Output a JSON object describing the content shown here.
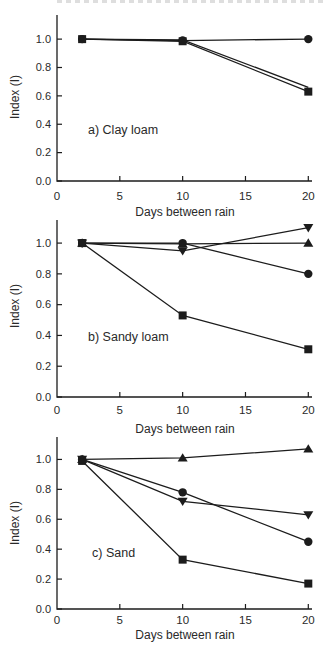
{
  "page": {
    "background": "#ffffff",
    "ink_color": "#1c1c1c",
    "text_color": "#2a2a2a"
  },
  "chart_data": [
    {
      "type": "line",
      "panel_label": "a) Clay loam",
      "xlabel": "Days between rain",
      "ylabel": "Index (I)",
      "x": [
        2,
        10,
        20
      ],
      "xticks": [
        0,
        5,
        10,
        15,
        20
      ],
      "yticks": [
        "0.0",
        "0.2",
        "0.4",
        "0.6",
        "0.8",
        "1.0"
      ],
      "xlim": [
        0,
        20
      ],
      "ylim": [
        0,
        1.17
      ],
      "grid": false,
      "legend": "none",
      "series": [
        {
          "name": "unmarked-companion-line",
          "marker": "none",
          "values": [
            1.0,
            0.995,
            0.66
          ]
        },
        {
          "name": "filled-square",
          "marker": "square",
          "values": [
            1.0,
            0.985,
            0.63
          ]
        },
        {
          "name": "filled-circle",
          "marker": "circle",
          "values": [
            1.0,
            0.99,
            1.0
          ]
        }
      ]
    },
    {
      "type": "line",
      "panel_label": "b) Sandy loam",
      "xlabel": "Days between rain",
      "ylabel": "Index (I)",
      "x": [
        2,
        10,
        20
      ],
      "xticks": [
        0,
        5,
        10,
        15,
        20
      ],
      "yticks": [
        "0.0",
        "0.2",
        "0.4",
        "0.6",
        "0.8",
        "1.0"
      ],
      "xlim": [
        0,
        20
      ],
      "ylim": [
        0,
        1.15
      ],
      "grid": false,
      "legend": "none",
      "series": [
        {
          "name": "filled-square",
          "marker": "square",
          "values": [
            1.0,
            0.53,
            0.31
          ]
        },
        {
          "name": "filled-triangle-down",
          "marker": "triangle-down",
          "values": [
            1.0,
            0.95,
            1.1
          ]
        },
        {
          "name": "filled-triangle-up",
          "marker": "triangle-up",
          "values": [
            1.0,
            0.995,
            1.0
          ]
        },
        {
          "name": "filled-circle",
          "marker": "circle",
          "values": [
            1.0,
            1.0,
            0.8
          ]
        }
      ]
    },
    {
      "type": "line",
      "panel_label": "c) Sand",
      "xlabel": "Days between rain",
      "ylabel": "Index (I)",
      "x": [
        2,
        10,
        20
      ],
      "xticks": [
        0,
        5,
        10,
        15,
        20
      ],
      "yticks": [
        "0.0",
        "0.2",
        "0.4",
        "0.6",
        "0.8",
        "1.0"
      ],
      "xlim": [
        0,
        20
      ],
      "ylim": [
        0,
        1.15
      ],
      "grid": false,
      "legend": "none",
      "series": [
        {
          "name": "filled-square",
          "marker": "square",
          "values": [
            0.99,
            0.33,
            0.17
          ]
        },
        {
          "name": "filled-triangle-down",
          "marker": "triangle-down",
          "values": [
            1.0,
            0.72,
            0.63
          ]
        },
        {
          "name": "filled-circle",
          "marker": "circle",
          "values": [
            1.0,
            0.78,
            0.45
          ]
        },
        {
          "name": "filled-triangle-up",
          "marker": "triangle-up",
          "values": [
            1.0,
            1.01,
            1.07
          ]
        }
      ]
    }
  ]
}
